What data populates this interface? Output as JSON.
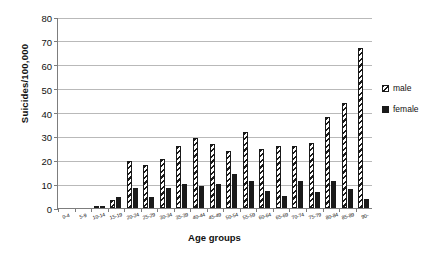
{
  "chart_data": {
    "type": "bar",
    "title": "",
    "xlabel": "Age groups",
    "ylabel": "Suicides/100,000",
    "ylim": [
      0,
      80
    ],
    "ytick_step": 10,
    "yticks": [
      0,
      10,
      20,
      30,
      40,
      50,
      60,
      70,
      80
    ],
    "grid": true,
    "legend_position": "right",
    "categories": [
      "0-4",
      "5-9",
      "10-14",
      "15-19",
      "20-24",
      "25-29",
      "30-34",
      "35-39",
      "40-44",
      "45-49",
      "50-54",
      "55-59",
      "60-64",
      "65-69",
      "70-74",
      "75-79",
      "80-84",
      "85-89",
      "90-"
    ],
    "series": [
      {
        "name": "male",
        "color": "#1a1a1a",
        "pattern": "diagonal-hatch",
        "values": [
          0,
          0,
          1.0,
          3.5,
          19.5,
          18.0,
          20.5,
          26.0,
          29.5,
          27.0,
          24.0,
          32.0,
          24.8,
          26.0,
          26.0,
          27.3,
          38.0,
          44.0,
          67.0
        ]
      },
      {
        "name": "female",
        "color": "#1a1a1a",
        "pattern": "solid",
        "values": [
          0,
          0,
          1.0,
          4.5,
          8.3,
          4.7,
          8.2,
          10.0,
          9.3,
          10.2,
          14.1,
          11.3,
          7.3,
          5.0,
          11.5,
          6.8,
          11.4,
          7.9,
          3.6
        ]
      }
    ],
    "legend": [
      "male",
      "female"
    ]
  }
}
